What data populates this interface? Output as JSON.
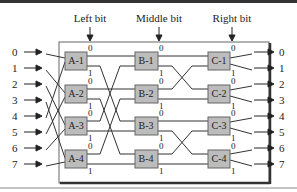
{
  "title_labels": {
    "left_bit": "Left bit",
    "middle_bit": "Middle bit",
    "right_bit": "Right bit"
  },
  "inputs": [
    "0",
    "1",
    "2",
    "3",
    "4",
    "5",
    "6",
    "7"
  ],
  "outputs": [
    "0",
    "1",
    "2",
    "3",
    "4",
    "5",
    "6",
    "7"
  ],
  "stages": [
    {
      "name": "A",
      "switches": [
        "A-1",
        "A-2",
        "A-3",
        "A-4"
      ]
    },
    {
      "name": "B",
      "switches": [
        "B-1",
        "B-2",
        "B-3",
        "B-4"
      ]
    },
    {
      "name": "C",
      "switches": [
        "C-1",
        "C-2",
        "C-3",
        "C-4"
      ]
    }
  ],
  "port_labels": {
    "top": "0",
    "bottom": "1"
  },
  "colors": {
    "switch_fill": "#bcbcbc",
    "line": "#333333",
    "border": "#444444"
  }
}
